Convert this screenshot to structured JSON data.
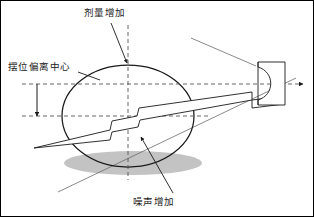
{
  "figure": {
    "title_present": false,
    "width": 314,
    "height": 217,
    "background": "#ffffff",
    "border": "#000000"
  },
  "labels": {
    "dose_increase": "剂量增加",
    "offset_from_center": "摆位偏离中心",
    "noise_increase": "噪声增加"
  },
  "colors": {
    "outline": "#1a1a1a",
    "dashed_axis": "#555555",
    "shadow": "#b3b3b3",
    "thin_line": "#6b6b6b",
    "text": "#1a1a1a"
  },
  "elements": {
    "patient_ellipse": "ellipse-patient-cross-section",
    "shadow_ellipse": "shadow-ellipse",
    "couch_wedge": "treatment-couch-wedge",
    "detector_block": "detector-block",
    "vertical_axis": "vertical-dashed-axis",
    "horizontal_axis_upper": "isocenter-dashed-axis",
    "horizontal_axis_lower": "patient-center-dashed-axis",
    "offset_arrow": "offset-distance-arrow",
    "beam_line_upper": "beam-line-upper",
    "beam_line_lower": "beam-line-lower"
  },
  "geometry": {
    "ellipse_center_x": 128,
    "ellipse_center_y": 116,
    "ellipse_rx": 66,
    "ellipse_ry": 51,
    "axis_upper_y": 84,
    "axis_lower_y": 116,
    "axis_vertical_x": 128,
    "axis_arrow_x": 303,
    "offset_arrow_x": 37
  }
}
